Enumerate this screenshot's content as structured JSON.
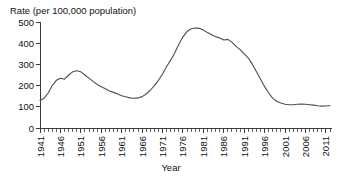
{
  "chart_data": {
    "type": "line",
    "title": "Rate (per 100,000 population)",
    "xlabel": "Year",
    "ylabel": "",
    "xlim": [
      1941,
      2012
    ],
    "ylim": [
      0,
      500
    ],
    "grid": false,
    "legend": null,
    "y_ticks": [
      0,
      100,
      200,
      300,
      400,
      500
    ],
    "y_tick_labels": [
      "0",
      "100",
      "200",
      "300",
      "400",
      "500"
    ],
    "x_ticks": [
      1941,
      1946,
      1951,
      1956,
      1961,
      1966,
      1971,
      1976,
      1981,
      1986,
      1991,
      1996,
      2001,
      2006,
      2011
    ],
    "x_tick_labels": [
      "1941",
      "1946",
      "1951",
      "1956",
      "1961",
      "1966",
      "1971",
      "1976",
      "1981",
      "1986",
      "1991",
      "1996",
      "2001",
      "2006",
      "2011"
    ],
    "x_minor_tick_step": 1,
    "series": [
      {
        "name": "Rate",
        "color": "#4d4d4d",
        "x": [
          1941,
          1942,
          1943,
          1944,
          1945,
          1946,
          1947,
          1948,
          1949,
          1950,
          1951,
          1952,
          1953,
          1954,
          1955,
          1956,
          1957,
          1958,
          1959,
          1960,
          1961,
          1962,
          1963,
          1964,
          1965,
          1966,
          1967,
          1968,
          1969,
          1970,
          1971,
          1972,
          1973,
          1974,
          1975,
          1976,
          1977,
          1978,
          1979,
          1980,
          1981,
          1982,
          1983,
          1984,
          1985,
          1986,
          1987,
          1988,
          1989,
          1990,
          1991,
          1992,
          1993,
          1994,
          1995,
          1996,
          1997,
          1998,
          1999,
          2000,
          2001,
          2002,
          2003,
          2004,
          2005,
          2006,
          2007,
          2008,
          2009,
          2010,
          2011,
          2012
        ],
        "y": [
          130,
          140,
          165,
          200,
          225,
          235,
          230,
          250,
          265,
          270,
          265,
          250,
          235,
          220,
          205,
          195,
          185,
          175,
          168,
          160,
          152,
          147,
          142,
          140,
          142,
          148,
          160,
          178,
          200,
          225,
          255,
          290,
          320,
          355,
          395,
          430,
          455,
          468,
          472,
          470,
          462,
          450,
          440,
          430,
          425,
          415,
          418,
          405,
          385,
          370,
          350,
          330,
          300,
          265,
          230,
          195,
          165,
          140,
          125,
          118,
          112,
          110,
          110,
          112,
          113,
          112,
          110,
          108,
          105,
          103,
          104,
          106
        ]
      }
    ]
  }
}
